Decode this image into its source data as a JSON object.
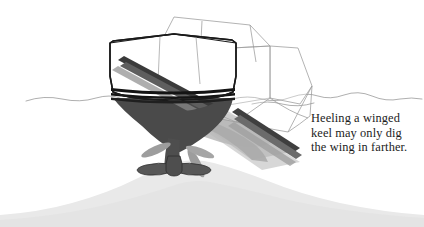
{
  "figure": {
    "title": "Heeling a winged keel may only dig the wing in farther.",
    "background_color": "#ffffff",
    "caption": {
      "lines": [
        "Heeling a winged",
        "keel may only dig",
        "the wing in farther."
      ],
      "color": "#1c1c1c"
    },
    "colors": {
      "hull_outline": "#1a1a1a",
      "hull_fill": "#ffffff",
      "underwater_hull": "#4a4a4a",
      "keel_bulb": "#4e4e4e",
      "boot_stripe": "#141414",
      "ghost_outline": "#9a9a9a",
      "ghost_fill": "#9e9e9e",
      "seabed": "#e9e9e9",
      "waterline": "#8d8d8d"
    },
    "elements": [
      {
        "name": "upright-hull",
        "label": "Upright hull",
        "state": "vertical"
      },
      {
        "name": "heeled-hull-ghost",
        "label": "Heeled hull",
        "state": "heeled to starboard"
      },
      {
        "name": "winged-keel",
        "label": "Winged keel",
        "state": "grounded"
      },
      {
        "name": "keel-wings",
        "label": "Keel wings",
        "count": 2
      },
      {
        "name": "waterline",
        "label": "Water surface"
      },
      {
        "name": "seabed-mound",
        "label": "Seabed / shoal"
      }
    ]
  }
}
